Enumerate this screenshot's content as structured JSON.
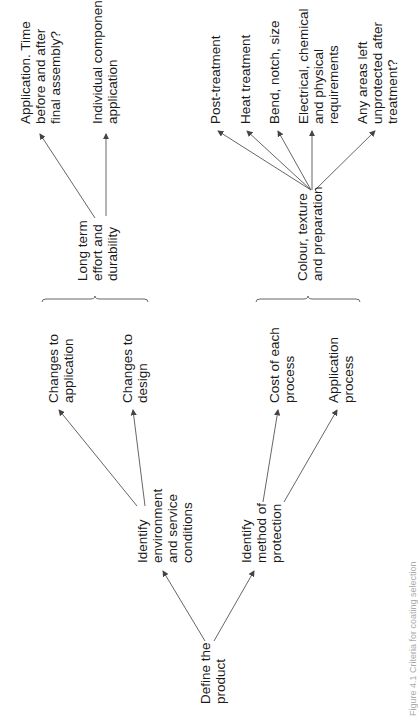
{
  "diagram": {
    "root": {
      "lines": [
        "Define the",
        "product"
      ]
    },
    "level1": [
      {
        "id": "env",
        "lines": [
          "Identify",
          "environment",
          "and service",
          "conditions"
        ]
      },
      {
        "id": "method",
        "lines": [
          "Identify",
          "method of",
          "protection"
        ]
      }
    ],
    "level2": [
      {
        "parent": "env",
        "lines": [
          "Changes to",
          "application"
        ]
      },
      {
        "parent": "env",
        "lines": [
          "Changes to",
          "design"
        ]
      },
      {
        "parent": "method",
        "lines": [
          "Cost of each",
          "process"
        ]
      },
      {
        "parent": "method",
        "lines": [
          "Application",
          "process"
        ]
      }
    ],
    "groups": [
      {
        "id": "durability",
        "lines": [
          "Long term",
          "effort and",
          "durability"
        ]
      },
      {
        "id": "colour",
        "lines": [
          "Colour, texture",
          "and preparation"
        ]
      }
    ],
    "level3": [
      {
        "parent": "durability",
        "lines": [
          "Application. Time",
          "before and after",
          "final assembly?"
        ]
      },
      {
        "parent": "durability",
        "lines": [
          "Individual component",
          "application"
        ]
      },
      {
        "parent": "colour",
        "lines": [
          "Post-treatment"
        ]
      },
      {
        "parent": "colour",
        "lines": [
          "Heat treatment"
        ]
      },
      {
        "parent": "colour",
        "lines": [
          "Bend, notch, size"
        ]
      },
      {
        "parent": "colour",
        "lines": [
          "Electrical, chemical",
          "and physical",
          "requirements"
        ]
      },
      {
        "parent": "colour",
        "lines": [
          "Any areas left",
          "unprotected after",
          "treatment?"
        ]
      }
    ],
    "caption": "Figure 4.1  Criteria for coating selection"
  }
}
